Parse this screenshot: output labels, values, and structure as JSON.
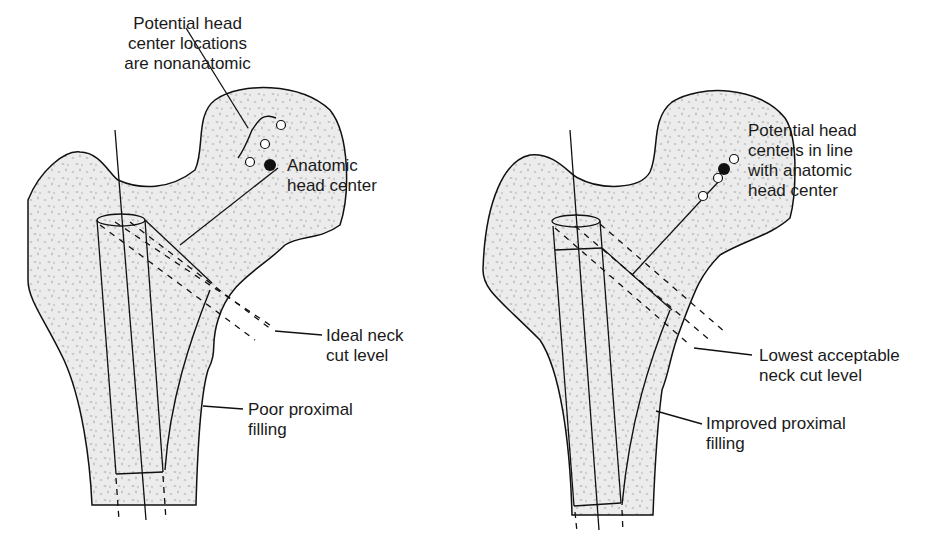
{
  "figure": {
    "left_panel": {
      "labels": {
        "nonanatomic_line1": "Potential head",
        "nonanatomic_line2": "center locations",
        "nonanatomic_line3": "are nonanatomic",
        "anatomic_line1": "Anatomic",
        "anatomic_line2": "head center",
        "neckcut_line1": "Ideal neck",
        "neckcut_line2": "cut level",
        "filling_line1": "Poor proximal",
        "filling_line2": "filling"
      }
    },
    "right_panel": {
      "labels": {
        "inline_line1": "Potential head",
        "inline_line2": "centers in line",
        "inline_line3": "with anatomic",
        "inline_line4": "head center",
        "neckcut_line1": "Lowest acceptable",
        "neckcut_line2": "neck cut level",
        "filling_line1": "Improved proximal",
        "filling_line2": "filling"
      }
    },
    "colors": {
      "bone_fill": "#ececec",
      "stroke": "#111111",
      "speckle": "#b8b8b8"
    }
  }
}
